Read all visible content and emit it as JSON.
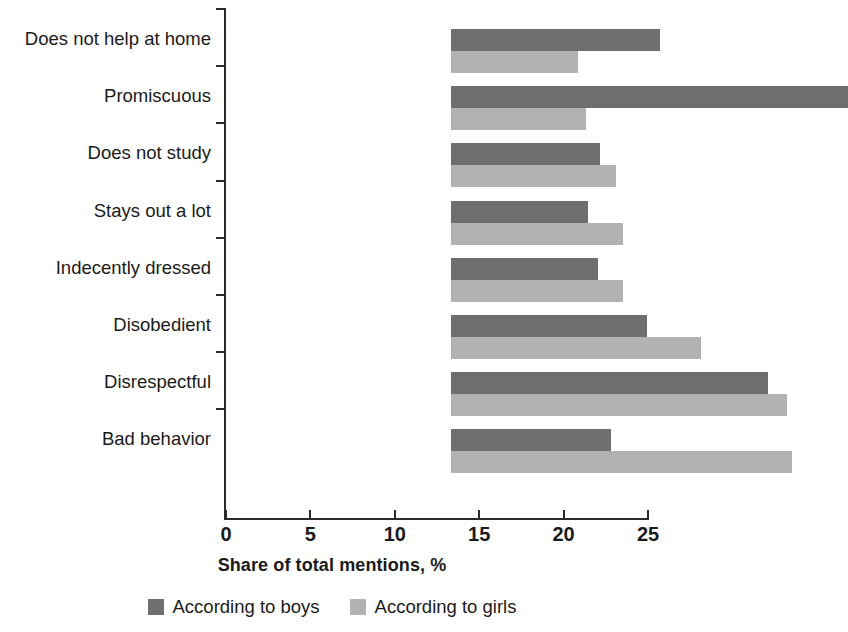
{
  "chart_data": {
    "type": "bar",
    "orientation": "horizontal",
    "title": "",
    "xlabel": "Share of total mentions, %",
    "ylabel": "",
    "xlim": [
      0,
      25
    ],
    "xticks": [
      0,
      5,
      10,
      15,
      20,
      25
    ],
    "xtick_labels": [
      "0",
      "5",
      "10",
      "15",
      "20",
      "25"
    ],
    "grid": false,
    "legend_position": "bottom",
    "categories": [
      "Does not help at home",
      "Promiscuous",
      "Does not study",
      "Stays out a lot",
      "Indecently dressed",
      "Disobedient",
      "Disrespectful",
      "Bad behavior"
    ],
    "series": [
      {
        "name": "According to boys",
        "color": "#6e6e6e",
        "values": [
          12.4,
          23.5,
          8.8,
          8.1,
          8.7,
          11.6,
          18.8,
          9.5
        ]
      },
      {
        "name": "According to girls",
        "color": "#b2b2b2",
        "values": [
          7.5,
          8.0,
          9.8,
          10.2,
          10.2,
          14.8,
          19.9,
          20.2
        ]
      }
    ]
  },
  "legend": {
    "items": [
      {
        "label": "According to boys",
        "color": "#6e6e6e"
      },
      {
        "label": "According to girls",
        "color": "#b2b2b2"
      }
    ]
  }
}
